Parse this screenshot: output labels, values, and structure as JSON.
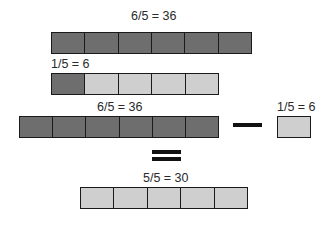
{
  "diagram": {
    "top": {
      "label": "6/5 = 36",
      "cells": [
        "dark",
        "dark",
        "dark",
        "dark",
        "dark",
        "dark"
      ]
    },
    "unit": {
      "label": "1/5 = 6",
      "cells": [
        "dark",
        "light",
        "light",
        "light",
        "light"
      ]
    },
    "equation": {
      "left": {
        "label": "6/5 = 36",
        "cells": [
          "dark",
          "dark",
          "dark",
          "dark",
          "dark",
          "dark"
        ]
      },
      "operator": "minus",
      "right": {
        "label": "1/5 = 6",
        "cells": [
          "light"
        ]
      },
      "equals": "equals",
      "result": {
        "label": "5/5 = 30",
        "cells": [
          "light",
          "light",
          "light",
          "light",
          "light"
        ]
      }
    }
  },
  "colors": {
    "dark": "#6e6e6e",
    "light": "#cfcfcf",
    "border": "#1a1a1a"
  }
}
